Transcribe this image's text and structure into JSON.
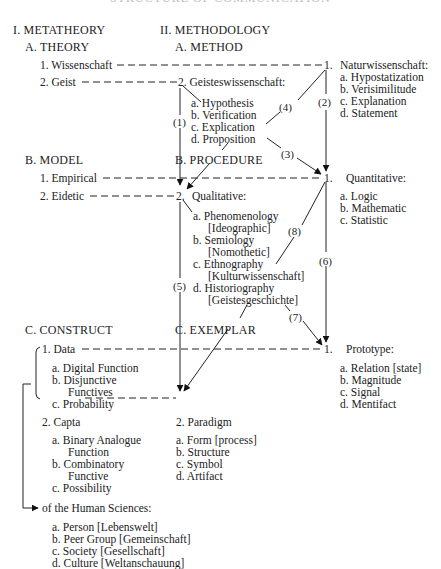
{
  "title": "STRUCTURE OF COMMUNICATION",
  "columns": {
    "left": "I. METATHEORY",
    "right": "II. METHODOLOGY"
  },
  "sections": {
    "theory": {
      "heading": "A. THEORY",
      "items": [
        "1.  Wissenschaft",
        "2.  Geist"
      ]
    },
    "method": {
      "heading": "A. METHOD",
      "item2": "2.  Geisteswissenschaft:",
      "sub2": [
        "a.  Hypothesis",
        "b.  Verification",
        "c.  Explication",
        "d.  Proposition"
      ],
      "item1": "1.",
      "item1_label": "Naturwissenschaft:",
      "sub1": [
        "a.  Hypostatization",
        "b.  Verisimilitude",
        "c.  Explanation",
        "d.  Statement"
      ]
    },
    "model": {
      "heading": "B. MODEL",
      "items": [
        "1.  Empirical",
        "2.  Eidetic"
      ]
    },
    "procedure": {
      "heading": "B.  PROCEDURE",
      "item2": "2.",
      "item2_label": "Qualitative:",
      "sub2": [
        "a.  Phenomenology",
        "[Ideographic]",
        "b.  Semiology",
        "[Nomothetic]",
        "c.  Ethnography",
        "[Kulturwissenschaft]",
        "d.  Historiography",
        "[Geistesgeschichte]"
      ],
      "item1": "1.",
      "item1_label": "Quantitative:",
      "sub1": [
        "a.  Logic",
        "b.  Mathematic",
        "c.  Statistic"
      ]
    },
    "construct": {
      "heading": "C.  CONSTRUCT",
      "item1": "1.  Data",
      "sub1": [
        "a.  Digital Function",
        "b.  Disjunctive",
        "Functives",
        "c.  Probability"
      ],
      "item2": "2.  Capta",
      "sub2": [
        "a.  Binary Analogue",
        "Function",
        "b.  Combinatory",
        "Functive",
        "c.  Possibility"
      ]
    },
    "exemplar": {
      "heading": "C.  EXEMPLAR",
      "item2": "2.  Paradigm",
      "sub2": [
        "a.  Form [process]",
        "b.  Structure",
        "c.  Symbol",
        "d.  Artifact"
      ],
      "item1": "1.",
      "item1_label": "Prototype:",
      "sub1": [
        "a.  Relation [state]",
        "b.  Magnitude",
        "c.  Signal",
        "d.  Mentifact"
      ]
    },
    "human": {
      "heading": "of the Human Sciences:",
      "items": [
        "a.  Person [Lebenswelt]",
        "b.  Peer Group [Gemeinschaft]",
        "c.  Society [Gesellschaft]",
        "d.  Culture [Weltanschauung]"
      ]
    }
  },
  "arrow_labels": [
    "(1)",
    "(2)",
    "(3)",
    "(4)",
    "(5)",
    "(6)",
    "(7)",
    "(8)"
  ]
}
